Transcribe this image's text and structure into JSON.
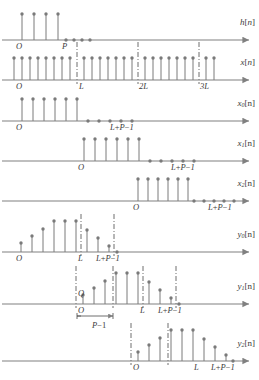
{
  "figure": {
    "axis_color": "#808080",
    "stem_color": "#7a7a7a",
    "dash_color": "#4a4a4a",
    "text_color": "#3a3a3a",
    "sample_spacing": 8.0,
    "origin_x": 14
  },
  "panels": [
    {
      "id": "h",
      "signal_label": "h[n]",
      "signal_sub": "",
      "axis_y": 40,
      "origin_x": 14,
      "tick_labels": [
        {
          "text": "O",
          "x": 16,
          "italic": true
        },
        {
          "text": "P",
          "x": 62,
          "italic": true
        }
      ],
      "stems": [
        {
          "x": 22,
          "h": 26
        },
        {
          "x": 34,
          "h": 26
        },
        {
          "x": 46,
          "h": 26
        },
        {
          "x": 58,
          "h": 26
        }
      ],
      "zeros": [
        66,
        74,
        82,
        90
      ],
      "dashed": []
    },
    {
      "id": "x",
      "signal_label": "x[n]",
      "signal_sub": "",
      "axis_y": 80,
      "origin_x": 14,
      "tick_labels": [
        {
          "text": "O",
          "x": 16,
          "italic": true
        },
        {
          "text": "L",
          "x": 79,
          "italic": true
        },
        {
          "text": "2L",
          "x": 139,
          "italic": true
        },
        {
          "text": "3L",
          "x": 200,
          "italic": true
        }
      ],
      "stems": [
        {
          "x": 14,
          "h": 22
        },
        {
          "x": 22,
          "h": 22
        },
        {
          "x": 30,
          "h": 22
        },
        {
          "x": 38,
          "h": 22
        },
        {
          "x": 46,
          "h": 22
        },
        {
          "x": 54,
          "h": 22
        },
        {
          "x": 62,
          "h": 22
        },
        {
          "x": 70,
          "h": 22
        },
        {
          "x": 84,
          "h": 22
        },
        {
          "x": 92,
          "h": 22
        },
        {
          "x": 100,
          "h": 22
        },
        {
          "x": 108,
          "h": 22
        },
        {
          "x": 116,
          "h": 22
        },
        {
          "x": 124,
          "h": 22
        },
        {
          "x": 132,
          "h": 22
        },
        {
          "x": 145,
          "h": 22
        },
        {
          "x": 153,
          "h": 22
        },
        {
          "x": 161,
          "h": 22
        },
        {
          "x": 169,
          "h": 22
        },
        {
          "x": 177,
          "h": 22
        },
        {
          "x": 185,
          "h": 22
        },
        {
          "x": 193,
          "h": 22
        },
        {
          "x": 206,
          "h": 22
        },
        {
          "x": 214,
          "h": 22
        }
      ],
      "zeros": [],
      "dashed": [
        77,
        138,
        199
      ]
    },
    {
      "id": "x0",
      "signal_label": "x",
      "signal_sub": "0",
      "signal_tail": "[n]",
      "axis_y": 121,
      "origin_x": 14,
      "tick_labels": [
        {
          "text": "O",
          "x": 16,
          "italic": true
        },
        {
          "text": "L+P−1",
          "x": 110,
          "italic": true
        }
      ],
      "stems": [
        {
          "x": 22,
          "h": 22
        },
        {
          "x": 33,
          "h": 22
        },
        {
          "x": 44,
          "h": 22
        },
        {
          "x": 55,
          "h": 22
        },
        {
          "x": 66,
          "h": 22
        },
        {
          "x": 77,
          "h": 22
        }
      ],
      "zeros": [
        88,
        99,
        110,
        121,
        132
      ],
      "dashed": []
    },
    {
      "id": "x1",
      "signal_label": "x",
      "signal_sub": "1",
      "signal_tail": "[n]",
      "axis_y": 161,
      "origin_x": 76,
      "tick_labels": [
        {
          "text": "O",
          "x": 78,
          "italic": true
        },
        {
          "text": "L+P−1",
          "x": 171,
          "italic": true
        }
      ],
      "stems": [
        {
          "x": 84,
          "h": 22
        },
        {
          "x": 95,
          "h": 22
        },
        {
          "x": 106,
          "h": 22
        },
        {
          "x": 117,
          "h": 22
        },
        {
          "x": 128,
          "h": 22
        },
        {
          "x": 139,
          "h": 22
        }
      ],
      "zeros": [
        150,
        161,
        172,
        183,
        194
      ],
      "dashed": []
    },
    {
      "id": "x2",
      "signal_label": "x",
      "signal_sub": "2",
      "signal_tail": "[n]",
      "axis_y": 201,
      "origin_x": 131,
      "tick_labels": [
        {
          "text": "O",
          "x": 133,
          "italic": true
        },
        {
          "text": "L+P−1",
          "x": 208,
          "italic": true
        }
      ],
      "stems": [
        {
          "x": 138,
          "h": 22
        },
        {
          "x": 148,
          "h": 22
        },
        {
          "x": 158,
          "h": 22
        },
        {
          "x": 168,
          "h": 22
        },
        {
          "x": 178,
          "h": 22
        },
        {
          "x": 188,
          "h": 22
        }
      ],
      "zeros": [
        194,
        204,
        214,
        224,
        234
      ],
      "dashed": []
    },
    {
      "id": "y0",
      "signal_label": "y",
      "signal_sub": "0",
      "signal_tail": "[n]",
      "axis_y": 252,
      "origin_x": 14,
      "tick_labels": [
        {
          "text": "O",
          "x": 16,
          "italic": true
        },
        {
          "text": "L",
          "x": 78,
          "italic": true
        },
        {
          "text": "L+P−1",
          "x": 96,
          "italic": true
        }
      ],
      "stems": [
        {
          "x": 21,
          "h": 9
        },
        {
          "x": 32,
          "h": 16
        },
        {
          "x": 43,
          "h": 23
        },
        {
          "x": 54,
          "h": 31
        },
        {
          "x": 65,
          "h": 31
        },
        {
          "x": 76,
          "h": 31
        },
        {
          "x": 87,
          "h": 22
        },
        {
          "x": 98,
          "h": 14
        },
        {
          "x": 109,
          "h": 6
        }
      ],
      "zeros": [
        117
      ],
      "dashed": [
        81,
        114
      ]
    },
    {
      "id": "y1",
      "signal_label": "y",
      "signal_sub": "1",
      "signal_tail": "[n]",
      "axis_y": 304,
      "origin_x": 76,
      "tick_labels": [
        {
          "text": "O",
          "x": 78,
          "italic": true
        },
        {
          "text": "L",
          "x": 140,
          "italic": true
        },
        {
          "text": "L+P−1",
          "x": 158,
          "italic": true
        }
      ],
      "stems": [
        {
          "x": 83,
          "h": 9
        },
        {
          "x": 94,
          "h": 16
        },
        {
          "x": 105,
          "h": 23
        },
        {
          "x": 116,
          "h": 31
        },
        {
          "x": 127,
          "h": 31
        },
        {
          "x": 138,
          "h": 31
        },
        {
          "x": 149,
          "h": 22
        },
        {
          "x": 160,
          "h": 14
        },
        {
          "x": 171,
          "h": 6
        }
      ],
      "zeros": [
        179
      ],
      "dashed": [
        76,
        113,
        143,
        176
      ]
    },
    {
      "id": "y2",
      "signal_label": "y",
      "signal_sub": "2",
      "signal_tail": "[n]",
      "axis_y": 361,
      "origin_x": 131,
      "tick_labels": [
        {
          "text": "O",
          "x": 133,
          "italic": true
        },
        {
          "text": "L",
          "x": 194,
          "italic": true
        },
        {
          "text": "L+P−1",
          "x": 211,
          "italic": true
        }
      ],
      "stems": [
        {
          "x": 138,
          "h": 9
        },
        {
          "x": 149,
          "h": 16
        },
        {
          "x": 160,
          "h": 23
        },
        {
          "x": 171,
          "h": 31
        },
        {
          "x": 182,
          "h": 31
        },
        {
          "x": 193,
          "h": 31
        },
        {
          "x": 204,
          "h": 22
        },
        {
          "x": 215,
          "h": 14
        },
        {
          "x": 226,
          "h": 6
        }
      ],
      "zeros": [
        233
      ],
      "dashed": [
        131,
        168
      ]
    }
  ],
  "annotations": {
    "q_label": "Q",
    "q_x": 78,
    "q_y": 289,
    "bracket_label": "P−1",
    "bracket_label_x": 92,
    "bracket_label_y": 321,
    "bracket_left": 77,
    "bracket_right": 113,
    "bracket_y": 316
  }
}
